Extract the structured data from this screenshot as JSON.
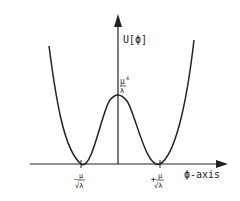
{
  "diagram": {
    "y_axis_label": "U[ϕ]",
    "x_axis_label": "ϕ-axis",
    "peak_label": {
      "numerator": "μ",
      "exponent": "4",
      "denominator": "λ"
    },
    "left_minimum_label": {
      "sign": "-",
      "numerator": "μ",
      "denominator": "√λ"
    },
    "right_minimum_label": {
      "sign": "+",
      "numerator": "μ",
      "denominator": "√λ"
    },
    "colors": {
      "line": "#222222",
      "background": "#ffffff"
    }
  }
}
